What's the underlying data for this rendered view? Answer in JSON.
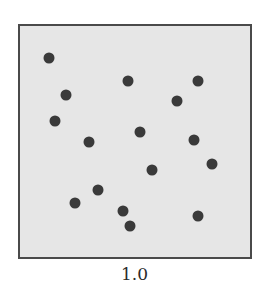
{
  "chart_data": {
    "type": "scatter",
    "title": "",
    "caption": "1.0",
    "xlabel": "",
    "ylabel": "",
    "grid": false,
    "legend": null,
    "axes_ticks": false,
    "colors": {
      "background": "#e6e6e6",
      "frame": "#4a4a4a",
      "point": "#3a3a3a"
    },
    "coordinate_note": "pixel positions within 269x297 image; no numeric axes shown",
    "points": [
      {
        "x": 49,
        "y": 58
      },
      {
        "x": 128,
        "y": 81
      },
      {
        "x": 198,
        "y": 81
      },
      {
        "x": 66,
        "y": 95
      },
      {
        "x": 177,
        "y": 101
      },
      {
        "x": 55,
        "y": 121
      },
      {
        "x": 140,
        "y": 132
      },
      {
        "x": 89,
        "y": 142
      },
      {
        "x": 194,
        "y": 140
      },
      {
        "x": 212,
        "y": 164
      },
      {
        "x": 152,
        "y": 170
      },
      {
        "x": 98,
        "y": 190
      },
      {
        "x": 75,
        "y": 203
      },
      {
        "x": 123,
        "y": 211
      },
      {
        "x": 198,
        "y": 216
      },
      {
        "x": 130,
        "y": 226
      }
    ]
  }
}
